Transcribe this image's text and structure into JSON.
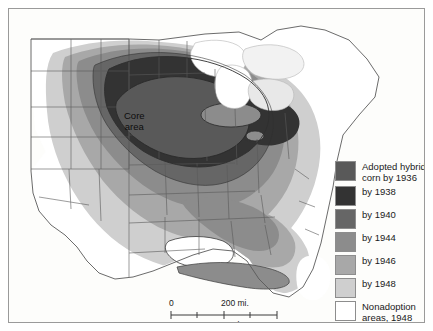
{
  "map": {
    "title": "Adoption of hybrid corn in the United States",
    "core_label": "Core\narea",
    "background_color": "#fdfdfb",
    "border_color": "#9a9a9a",
    "state_line_color": "#4d4d4d",
    "zone_line_color": "#3a3a3a"
  },
  "legend": {
    "items": [
      {
        "label": "Adopted hybrid\ncorn by 1936",
        "color": "#595959",
        "year": 1936
      },
      {
        "label": "by 1938",
        "color": "#333333",
        "year": 1938
      },
      {
        "label": "by 1940",
        "color": "#666666",
        "year": 1940
      },
      {
        "label": "by 1944",
        "color": "#8c8c8c",
        "year": 1944
      },
      {
        "label": "by 1946",
        "color": "#a8a8a8",
        "year": 1946
      },
      {
        "label": "by 1948",
        "color": "#cfcfcf",
        "year": 1948
      },
      {
        "label": "Nonadoption\nareas, 1948",
        "color": "#ffffff",
        "year": 1948
      }
    ]
  },
  "scalebar": {
    "miles_zero": "0",
    "miles_value": "200 mi.",
    "km_zero": "0",
    "km_value": "400 km."
  }
}
